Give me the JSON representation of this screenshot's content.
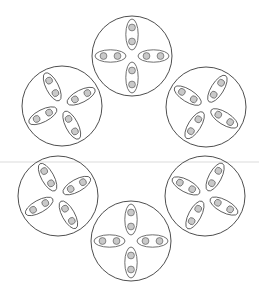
{
  "canvas": {
    "width": 259,
    "height": 289,
    "background": "#ffffff"
  },
  "style": {
    "outer_circle_stroke": "#3a3a3a",
    "outer_circle_stroke_width": 0.9,
    "outer_circle_fill": "none",
    "ellipse_stroke": "#4a4a4a",
    "ellipse_stroke_width": 0.8,
    "ellipse_fill": "#ffffff",
    "dot_stroke": "#6e6e6e",
    "dot_stroke_width": 0.8,
    "dot_fill": "#c9c9c9",
    "guide_line_color": "#dcdcdc",
    "guide_line_width": 1.2
  },
  "guide_line": {
    "name": "horizontal-guide-line",
    "x1": 0,
    "y1": 162,
    "x2": 259,
    "y2": 162
  },
  "geometry": {
    "ellipse_rx": 15.5,
    "ellipse_ry": 6.2,
    "dot_r": 3.4,
    "dot_offset": 7.0,
    "lobe_distance": 21.5
  },
  "units": [
    {
      "id": "unit-top",
      "label": "Top cell",
      "cx": 132,
      "cy": 56,
      "r": 40,
      "rotation": 0,
      "lobes": [
        {
          "angle": 90,
          "label": "lobe-north"
        },
        {
          "angle": 180,
          "label": "lobe-west"
        },
        {
          "angle": 0,
          "label": "lobe-east"
        },
        {
          "angle": 270,
          "label": "lobe-south"
        }
      ]
    },
    {
      "id": "unit-upper-right",
      "label": "Upper right cell",
      "cx": 206,
      "cy": 107,
      "r": 40,
      "rotation": 58,
      "lobes": [
        {
          "angle": 90,
          "label": "lobe-north"
        },
        {
          "angle": 180,
          "label": "lobe-west"
        },
        {
          "angle": 0,
          "label": "lobe-east"
        },
        {
          "angle": 270,
          "label": "lobe-south"
        }
      ]
    },
    {
      "id": "unit-lower-right",
      "label": "Lower right cell",
      "cx": 205,
      "cy": 196,
      "r": 40,
      "rotation": 62,
      "lobes": [
        {
          "angle": 90,
          "label": "lobe-north"
        },
        {
          "angle": 180,
          "label": "lobe-west"
        },
        {
          "angle": 0,
          "label": "lobe-east"
        },
        {
          "angle": 270,
          "label": "lobe-south"
        }
      ]
    },
    {
      "id": "unit-bottom",
      "label": "Bottom cell",
      "cx": 131,
      "cy": 241,
      "r": 40,
      "rotation": 0,
      "lobes": [
        {
          "angle": 90,
          "label": "lobe-north"
        },
        {
          "angle": 180,
          "label": "lobe-west"
        },
        {
          "angle": 0,
          "label": "lobe-east"
        },
        {
          "angle": 270,
          "label": "lobe-south"
        }
      ]
    },
    {
      "id": "unit-lower-left",
      "label": "Lower left cell",
      "cx": 58,
      "cy": 196,
      "r": 40,
      "rotation": 29,
      "lobes": [
        {
          "angle": 90,
          "label": "lobe-north"
        },
        {
          "angle": 180,
          "label": "lobe-west"
        },
        {
          "angle": 0,
          "label": "lobe-east"
        },
        {
          "angle": 270,
          "label": "lobe-south"
        }
      ]
    },
    {
      "id": "unit-upper-left",
      "label": "Upper left cell",
      "cx": 62,
      "cy": 106,
      "r": 40,
      "rotation": 27,
      "lobes": [
        {
          "angle": 90,
          "label": "lobe-north"
        },
        {
          "angle": 180,
          "label": "lobe-west"
        },
        {
          "angle": 0,
          "label": "lobe-east"
        },
        {
          "angle": 270,
          "label": "lobe-south"
        }
      ]
    }
  ]
}
